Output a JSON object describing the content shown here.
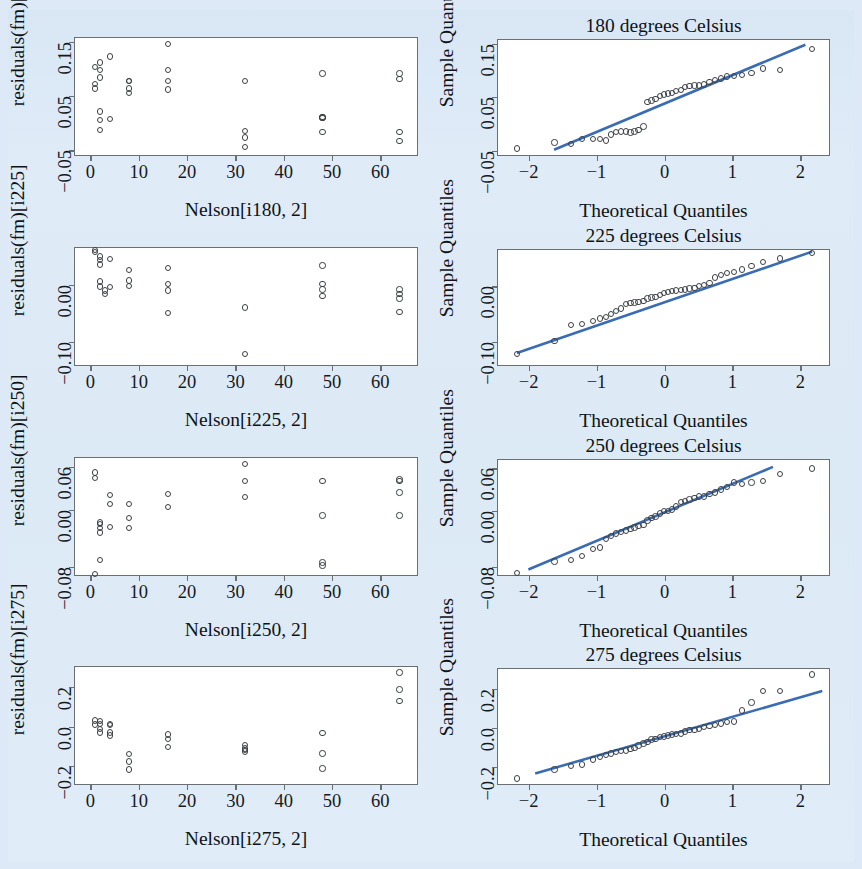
{
  "figure": {
    "background_color": "#dceaf6",
    "panel_background": "#ffffff",
    "frame_color": "#6a6f74",
    "point_color": "#3c4045",
    "line_color": "#3a6bb5",
    "rows": 4,
    "columns": 2
  },
  "chart_data": [
    {
      "id": "resid-180",
      "type": "scatter",
      "title": "",
      "xlabel": "Nelson[i180, 2]",
      "ylabel": "residuals(fm)[i180]",
      "xlim": [
        -3.2,
        68
      ],
      "ylim": [
        -0.062,
        0.157
      ],
      "xticks": [
        0,
        10,
        20,
        30,
        40,
        50,
        60
      ],
      "xticklabels": [
        "0",
        "10",
        "20",
        "30",
        "40",
        "50",
        "60"
      ],
      "yticks": [
        -0.05,
        0.05,
        0.15
      ],
      "yticklabels": [
        "-0.05",
        "0.05",
        "0.15"
      ],
      "grid": false,
      "legend": "none",
      "x": [
        1,
        1,
        1,
        2,
        2,
        2,
        2,
        2,
        2,
        4,
        4,
        8,
        8,
        8,
        8,
        16,
        16,
        16,
        16,
        32,
        32,
        32,
        32,
        48,
        48,
        48,
        48,
        48,
        64,
        64,
        64,
        64
      ],
      "y": [
        0.104,
        0.072,
        0.064,
        0.112,
        0.098,
        0.084,
        0.022,
        0.006,
        -0.012,
        0.123,
        0.008,
        0.078,
        0.064,
        0.056,
        0.078,
        0.146,
        0.098,
        0.078,
        0.062,
        0.078,
        -0.014,
        -0.026,
        -0.044,
        0.092,
        0.012,
        0.011,
        0.01,
        -0.016,
        0.092,
        0.081,
        -0.016,
        -0.032
      ]
    },
    {
      "id": "qq-180",
      "type": "scatter",
      "title": "180 degrees Celsius",
      "xlabel": "Theoretical Quantiles",
      "ylabel": "Sample Quantiles",
      "xlim": [
        -2.45,
        2.45
      ],
      "ylim": [
        -0.062,
        0.157
      ],
      "xticks": [
        -2,
        -1,
        0,
        1,
        2
      ],
      "xticklabels": [
        "-2",
        "-1",
        "0",
        "1",
        "2"
      ],
      "yticks": [
        -0.05,
        0.05,
        0.15
      ],
      "yticklabels": [
        "-0.05",
        "0.05",
        "0.15"
      ],
      "grid": false,
      "legend": "none",
      "reference_line": {
        "x": [
          -1.62,
          2.1
        ],
        "y": [
          -0.052,
          0.148
        ]
      },
      "x": [
        -2.17,
        -1.62,
        -1.38,
        -1.21,
        -1.05,
        -0.95,
        -0.86,
        -0.79,
        -0.71,
        -0.64,
        -0.57,
        -0.5,
        -0.44,
        -0.38,
        -0.31,
        -0.25,
        -0.19,
        -0.13,
        -0.07,
        -0.01,
        0.05,
        0.11,
        0.17,
        0.24,
        0.3,
        0.37,
        0.44,
        0.51,
        0.58,
        0.66,
        0.74,
        0.83,
        0.92,
        1.02,
        1.14,
        1.28,
        1.45,
        1.7,
        2.17
      ],
      "y": [
        -0.046,
        -0.035,
        -0.038,
        -0.028,
        -0.028,
        -0.028,
        -0.031,
        -0.02,
        -0.015,
        -0.014,
        -0.014,
        -0.016,
        -0.014,
        -0.012,
        -0.005,
        0.041,
        0.044,
        0.047,
        0.052,
        0.055,
        0.057,
        0.058,
        0.062,
        0.063,
        0.069,
        0.071,
        0.072,
        0.072,
        0.074,
        0.078,
        0.082,
        0.085,
        0.089,
        0.09,
        0.092,
        0.095,
        0.104,
        0.101,
        0.14
      ]
    },
    {
      "id": "resid-225",
      "type": "scatter",
      "title": "",
      "xlabel": "Nelson[i225, 2]",
      "ylabel": "residuals(fm)[i225]",
      "xlim": [
        -3.2,
        68
      ],
      "ylim": [
        -0.145,
        0.065
      ],
      "xticks": [
        0,
        10,
        20,
        30,
        40,
        50,
        60
      ],
      "xticklabels": [
        "0",
        "10",
        "20",
        "30",
        "40",
        "50",
        "60"
      ],
      "yticks": [
        -0.1,
        0.0
      ],
      "yticklabels": [
        "-0.10",
        "0.00"
      ],
      "grid": false,
      "legend": "none",
      "x": [
        1,
        1,
        2,
        2,
        2,
        2,
        2,
        3,
        3,
        4,
        4,
        8,
        8,
        8,
        16,
        16,
        16,
        16,
        32,
        32,
        48,
        48,
        48,
        48,
        64,
        64,
        64,
        64
      ],
      "y": [
        0.062,
        0.058,
        0.05,
        0.044,
        0.036,
        0.006,
        -0.003,
        -0.01,
        -0.016,
        0.046,
        -0.004,
        0.026,
        0.008,
        -0.002,
        0.03,
        0.002,
        -0.01,
        -0.05,
        -0.04,
        -0.122,
        0.034,
        0.002,
        -0.008,
        -0.02,
        -0.048,
        -0.008,
        -0.016,
        -0.024
      ],
      "note": "28 residual values grouped by x"
    },
    {
      "id": "qq-225",
      "type": "scatter",
      "title": "225 degrees Celsius",
      "xlabel": "Theoretical Quantiles",
      "ylabel": "Sample Quantiles",
      "xlim": [
        -2.45,
        2.45
      ],
      "ylim": [
        -0.145,
        0.065
      ],
      "xticks": [
        -2,
        -1,
        0,
        1,
        2
      ],
      "xticklabels": [
        "-2",
        "-1",
        "0",
        "1",
        "2"
      ],
      "yticks": [
        -0.1,
        0.0
      ],
      "yticklabels": [
        "-0.10",
        "0.00"
      ],
      "grid": false,
      "legend": "none",
      "reference_line": {
        "x": [
          -2.17,
          2.2
        ],
        "y": [
          -0.123,
          0.062
        ]
      },
      "x": [
        -2.17,
        -1.62,
        -1.38,
        -1.21,
        -1.05,
        -0.95,
        -0.86,
        -0.79,
        -0.71,
        -0.64,
        -0.57,
        -0.5,
        -0.44,
        -0.38,
        -0.31,
        -0.25,
        -0.19,
        -0.13,
        -0.07,
        -0.01,
        0.05,
        0.11,
        0.17,
        0.24,
        0.3,
        0.37,
        0.44,
        0.51,
        0.58,
        0.66,
        0.74,
        0.83,
        0.92,
        1.02,
        1.14,
        1.28,
        1.45,
        1.7,
        2.17
      ],
      "y": [
        -0.122,
        -0.098,
        -0.07,
        -0.068,
        -0.062,
        -0.058,
        -0.055,
        -0.05,
        -0.044,
        -0.04,
        -0.032,
        -0.03,
        -0.029,
        -0.028,
        -0.026,
        -0.022,
        -0.02,
        -0.019,
        -0.016,
        -0.012,
        -0.01,
        -0.009,
        -0.008,
        -0.007,
        -0.006,
        -0.004,
        -0.003,
        0.0,
        0.002,
        0.006,
        0.016,
        0.02,
        0.024,
        0.026,
        0.03,
        0.036,
        0.044,
        0.05,
        0.06
      ]
    },
    {
      "id": "resid-250",
      "type": "scatter",
      "title": "",
      "xlabel": "Nelson[i250, 2]",
      "ylabel": "residuals(fm)[i250]",
      "xlim": [
        -3.2,
        68
      ],
      "ylim": [
        -0.094,
        0.072
      ],
      "xticks": [
        0,
        10,
        20,
        30,
        40,
        50,
        60
      ],
      "xticklabels": [
        "0",
        "10",
        "20",
        "30",
        "40",
        "50",
        "60"
      ],
      "yticks": [
        -0.08,
        0.0,
        0.06
      ],
      "yticklabels": [
        "-0.08",
        "0.00",
        "0.06"
      ],
      "grid": false,
      "legend": "none",
      "x": [
        1,
        1,
        1,
        2,
        2,
        2,
        2,
        2,
        4,
        4,
        4,
        8,
        8,
        8,
        16,
        16,
        32,
        32,
        32,
        48,
        48,
        48,
        48,
        64,
        64,
        64,
        64
      ],
      "y": [
        0.052,
        0.044,
        -0.09,
        -0.018,
        -0.02,
        -0.026,
        -0.032,
        -0.07,
        0.02,
        0.008,
        -0.024,
        0.008,
        -0.012,
        -0.026,
        0.022,
        0.004,
        0.064,
        0.04,
        0.018,
        0.04,
        -0.008,
        -0.074,
        -0.078,
        0.042,
        0.04,
        0.024,
        -0.008
      ]
    },
    {
      "id": "qq-250",
      "type": "scatter",
      "title": "250 degrees Celsius",
      "xlabel": "Theoretical Quantiles",
      "ylabel": "Sample Quantiles",
      "xlim": [
        -2.45,
        2.45
      ],
      "ylim": [
        -0.094,
        0.072
      ],
      "xticks": [
        -2,
        -1,
        0,
        1,
        2
      ],
      "xticklabels": [
        "-2",
        "-1",
        "0",
        "1",
        "2"
      ],
      "yticks": [
        -0.08,
        0.0,
        0.06
      ],
      "yticklabels": [
        "-0.08",
        "0.00",
        "0.06"
      ],
      "grid": false,
      "legend": "none",
      "reference_line": {
        "x": [
          -2.0,
          1.62
        ],
        "y": [
          -0.086,
          0.062
        ]
      },
      "x": [
        -2.17,
        -1.62,
        -1.38,
        -1.21,
        -1.05,
        -0.95,
        -0.86,
        -0.79,
        -0.71,
        -0.64,
        -0.57,
        -0.5,
        -0.44,
        -0.38,
        -0.31,
        -0.25,
        -0.19,
        -0.13,
        -0.07,
        -0.01,
        0.05,
        0.11,
        0.17,
        0.24,
        0.3,
        0.37,
        0.44,
        0.51,
        0.58,
        0.66,
        0.74,
        0.83,
        0.92,
        1.02,
        1.14,
        1.28,
        1.45,
        1.7,
        2.17
      ],
      "y": [
        -0.088,
        -0.072,
        -0.07,
        -0.064,
        -0.054,
        -0.052,
        -0.04,
        -0.036,
        -0.032,
        -0.03,
        -0.028,
        -0.026,
        -0.024,
        -0.022,
        -0.02,
        -0.014,
        -0.01,
        -0.008,
        -0.004,
        0.0,
        0.0,
        0.002,
        0.006,
        0.012,
        0.014,
        0.016,
        0.018,
        0.02,
        0.02,
        0.024,
        0.026,
        0.03,
        0.034,
        0.04,
        0.038,
        0.04,
        0.042,
        0.052,
        0.06
      ]
    },
    {
      "id": "resid-275",
      "type": "scatter",
      "title": "",
      "xlabel": "Nelson[i275, 2]",
      "ylabel": "residuals(fm)[i275]",
      "xlim": [
        -3.2,
        68
      ],
      "ylim": [
        -0.3,
        0.3
      ],
      "xticks": [
        0,
        10,
        20,
        30,
        40,
        50,
        60
      ],
      "xticklabels": [
        "0",
        "10",
        "20",
        "30",
        "40",
        "50",
        "60"
      ],
      "yticks": [
        -0.2,
        0.0,
        0.2
      ],
      "yticklabels": [
        "-0.2",
        "0.0",
        "0.2"
      ],
      "grid": false,
      "legend": "none",
      "x": [
        1,
        1,
        2,
        2,
        2,
        2,
        4,
        4,
        4,
        4,
        8,
        8,
        8,
        16,
        16,
        16,
        32,
        32,
        32,
        32,
        48,
        48,
        48,
        64,
        64,
        64
      ],
      "y": [
        0.03,
        0.01,
        0.028,
        0.014,
        -0.012,
        -0.03,
        0.014,
        0.008,
        -0.03,
        -0.046,
        -0.14,
        -0.176,
        -0.216,
        -0.04,
        -0.062,
        -0.104,
        -0.092,
        -0.11,
        -0.118,
        -0.126,
        -0.034,
        -0.136,
        -0.212,
        0.272,
        0.186,
        0.128
      ]
    },
    {
      "id": "qq-275",
      "type": "scatter",
      "title": "275 degrees Celsius",
      "xlabel": "Theoretical Quantiles",
      "ylabel": "Sample Quantiles",
      "xlim": [
        -2.45,
        2.45
      ],
      "ylim": [
        -0.3,
        0.3
      ],
      "xticks": [
        -2,
        -1,
        0,
        1,
        2
      ],
      "xticklabels": [
        "-2",
        "-1",
        "0",
        "1",
        "2"
      ],
      "yticks": [
        -0.2,
        0.0,
        0.2
      ],
      "yticklabels": [
        "-0.2",
        "0.0",
        "0.2"
      ],
      "grid": false,
      "legend": "none",
      "reference_line": {
        "x": [
          -1.9,
          2.35
        ],
        "y": [
          -0.245,
          0.185
        ]
      },
      "x": [
        -2.17,
        -1.62,
        -1.38,
        -1.21,
        -1.05,
        -0.95,
        -0.86,
        -0.79,
        -0.71,
        -0.64,
        -0.57,
        -0.5,
        -0.44,
        -0.38,
        -0.31,
        -0.25,
        -0.19,
        -0.13,
        -0.07,
        -0.01,
        0.05,
        0.11,
        0.17,
        0.24,
        0.3,
        0.37,
        0.44,
        0.51,
        0.58,
        0.66,
        0.74,
        0.83,
        0.92,
        1.02,
        1.14,
        1.28,
        1.45,
        1.7,
        2.17
      ],
      "y": [
        -0.262,
        -0.216,
        -0.196,
        -0.19,
        -0.164,
        -0.15,
        -0.14,
        -0.134,
        -0.126,
        -0.12,
        -0.118,
        -0.11,
        -0.104,
        -0.092,
        -0.082,
        -0.074,
        -0.062,
        -0.058,
        -0.05,
        -0.046,
        -0.04,
        -0.036,
        -0.034,
        -0.03,
        -0.02,
        -0.014,
        -0.012,
        -0.008,
        0.004,
        0.008,
        0.014,
        0.02,
        0.028,
        0.03,
        0.088,
        0.128,
        0.186,
        0.186,
        0.272
      ]
    }
  ]
}
